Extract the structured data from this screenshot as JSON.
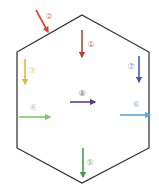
{
  "diagram": {
    "shape": "hexagon",
    "hexagon_points": "82,15 149,52 149,148 82,183 17,148 17,52",
    "stroke_color": "#2a2a2a",
    "arrows": [
      {
        "id": "1",
        "label": "①",
        "color": "#b0473a",
        "x1": 82,
        "y1": 30,
        "x2": 82,
        "y2": 57,
        "lx": 91,
        "ly": 47
      },
      {
        "id": "2",
        "label": "②",
        "color": "#e0402f",
        "x1": 36,
        "y1": 10,
        "x2": 48,
        "y2": 32,
        "lx": 49,
        "ly": 19
      },
      {
        "id": "3",
        "label": "③",
        "color": "#f2b233",
        "x1": 25,
        "y1": 59,
        "x2": 25,
        "y2": 84,
        "lx": 32,
        "ly": 73
      },
      {
        "id": "4",
        "label": "④",
        "color": "#7dc96a",
        "x1": 19,
        "y1": 117,
        "x2": 50,
        "y2": 117,
        "lx": 33,
        "ly": 110
      },
      {
        "id": "5",
        "label": "⑤",
        "color": "#4a9a4a",
        "x1": 83,
        "y1": 148,
        "x2": 83,
        "y2": 177,
        "lx": 90,
        "ly": 165
      },
      {
        "id": "6",
        "label": "⑥",
        "color": "#5ca8e0",
        "x1": 120,
        "y1": 115,
        "x2": 150,
        "y2": 115,
        "lx": 136,
        "ly": 107
      },
      {
        "id": "7",
        "label": "⑦",
        "color": "#3b60b0",
        "x1": 139,
        "y1": 56,
        "x2": 139,
        "y2": 82,
        "lx": 131,
        "ly": 69
      },
      {
        "id": "8",
        "label": "⑧",
        "color": "#5a3e8a",
        "x1": 70,
        "y1": 102,
        "x2": 95,
        "y2": 102,
        "lx": 82,
        "ly": 96
      }
    ]
  }
}
